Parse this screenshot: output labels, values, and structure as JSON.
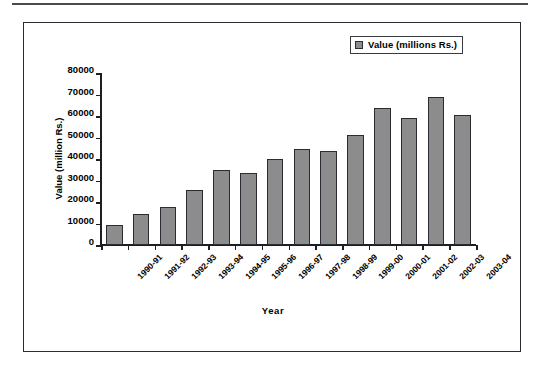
{
  "figure": {
    "has_top_rule": true,
    "frame_border_color": "#2b2b33",
    "background": "#ffffff"
  },
  "legend": {
    "position": "top-right",
    "swatch_color": "#8c8c8c",
    "label": "Value (millions Rs.)"
  },
  "axes": {
    "ylabel": "Value (million Rs.)",
    "xlabel": "Year",
    "yticks": [
      "80000",
      "70000",
      "60000",
      "50000",
      "40000",
      "30000",
      "20000",
      "10000",
      "0"
    ]
  },
  "chart_data": {
    "type": "bar",
    "title": "",
    "xlabel": "Year",
    "ylabel": "Value (million Rs.)",
    "ylim": [
      0,
      80000
    ],
    "ytick_step": 10000,
    "grid": false,
    "legend_position": "top-right",
    "series_name": "Value (millions Rs.)",
    "bar_color": "#8c8c8c",
    "bar_edge_color": "#2b2b33",
    "categories": [
      "1990-91",
      "1991-92",
      "1992-93",
      "1993-94",
      "1994-95",
      "1995-96",
      "1996-97",
      "1997-98",
      "1998-99",
      "1999-00",
      "2000-01",
      "2001-02",
      "2002-03",
      "2003-04"
    ],
    "values": [
      9300,
      14600,
      17500,
      25400,
      35000,
      33500,
      40000,
      44500,
      43700,
      51200,
      63500,
      59000,
      69000,
      60700
    ]
  }
}
